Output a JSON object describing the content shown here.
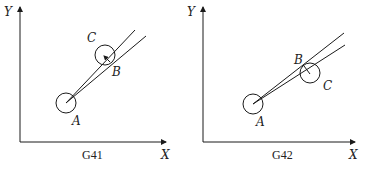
{
  "panels": [
    {
      "id": "g41",
      "caption": "G41",
      "axis_x_label": "X",
      "axis_y_label": "Y",
      "point_labels": {
        "A": "A",
        "B": "B",
        "C": "C"
      }
    },
    {
      "id": "g42",
      "caption": "G42",
      "axis_x_label": "X",
      "axis_y_label": "Y",
      "point_labels": {
        "A": "A",
        "B": "B",
        "C": "C"
      }
    }
  ],
  "colors": {
    "stroke": "#1a1a1a",
    "background": "#ffffff"
  }
}
